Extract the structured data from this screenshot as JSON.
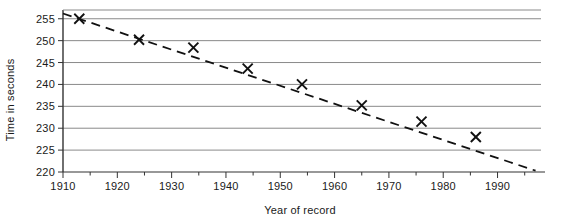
{
  "chart_data": {
    "type": "scatter",
    "title": "",
    "subtitle": "",
    "xlabel": "Year of record",
    "ylabel": "Time in seconds",
    "xlim": [
      1910,
      1998
    ],
    "ylim": [
      220,
      257
    ],
    "grid": "horizontal",
    "legend": "none",
    "marker": "x",
    "x_ticks": [
      1910,
      1920,
      1930,
      1940,
      1950,
      1960,
      1970,
      1980,
      1990
    ],
    "x_tick_labels": [
      "1910",
      "1920",
      "1930",
      "1940",
      "1950",
      "1960",
      "1970",
      "1980",
      "1990"
    ],
    "x_minor_ticks": [
      1915,
      1925,
      1935,
      1945,
      1955,
      1965,
      1975,
      1985,
      1995
    ],
    "y_ticks": [
      220,
      225,
      230,
      235,
      240,
      245,
      250,
      255
    ],
    "y_tick_labels": [
      "220",
      "225",
      "230",
      "235",
      "240",
      "245",
      "250",
      "255"
    ],
    "points": [
      {
        "x": 1913,
        "y": 255.0
      },
      {
        "x": 1924,
        "y": 250.2
      },
      {
        "x": 1934,
        "y": 248.4
      },
      {
        "x": 1944,
        "y": 243.6
      },
      {
        "x": 1954,
        "y": 240.0
      },
      {
        "x": 1965,
        "y": 235.2
      },
      {
        "x": 1976,
        "y": 231.5
      },
      {
        "x": 1986,
        "y": 228.0
      }
    ],
    "trend_line": {
      "style": "dashed",
      "start": {
        "x": 1910,
        "y": 256.2
      },
      "end": {
        "x": 1997,
        "y": 220.3
      }
    },
    "colors": {
      "marker": "#111111",
      "trend": "#111111",
      "grid": "#8a8a8a",
      "axis": "#333333",
      "background": "#ffffff"
    }
  }
}
